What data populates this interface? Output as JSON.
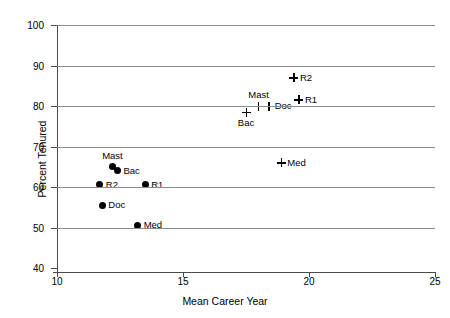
{
  "chart_data": {
    "type": "scatter",
    "title": "",
    "xlabel": "Mean Career Year",
    "ylabel": "Percent Tenured",
    "xlim": [
      10,
      25
    ],
    "ylim": [
      40,
      100
    ],
    "xticks": [
      10,
      15,
      20,
      25
    ],
    "yticks": [
      40,
      50,
      60,
      70,
      80,
      90,
      100
    ],
    "grid": "horizontal",
    "legend": "none",
    "series": [
      {
        "name": "filled-circle-group",
        "marker": "filled-circle",
        "points": [
          {
            "label": "Mast",
            "x": 12.2,
            "y": 65.0,
            "label_pos": "above"
          },
          {
            "label": "Bac",
            "x": 12.4,
            "y": 64.0,
            "label_pos": "right"
          },
          {
            "label": "R2",
            "x": 11.7,
            "y": 60.5,
            "label_pos": "right"
          },
          {
            "label": "R1",
            "x": 13.5,
            "y": 60.5,
            "label_pos": "right"
          },
          {
            "label": "Doc",
            "x": 11.8,
            "y": 55.5,
            "label_pos": "right"
          },
          {
            "label": "Med",
            "x": 13.2,
            "y": 50.5,
            "label_pos": "right"
          }
        ]
      },
      {
        "name": "plus-marker-group",
        "marker": "plus",
        "points": [
          {
            "label": "R2",
            "x": 19.4,
            "y": 87.0,
            "label_pos": "right"
          },
          {
            "label": "R1",
            "x": 19.6,
            "y": 81.5,
            "label_pos": "right"
          },
          {
            "label": "Mast",
            "x": 18.0,
            "y": 80.0,
            "label_pos": "above"
          },
          {
            "label": "Doc",
            "x": 18.4,
            "y": 80.0,
            "label_pos": "right"
          },
          {
            "label": "Bac",
            "x": 17.5,
            "y": 78.5,
            "label_pos": "below"
          },
          {
            "label": "Med",
            "x": 18.9,
            "y": 66.0,
            "label_pos": "right"
          }
        ]
      }
    ],
    "colors": {
      "marker": "#000000",
      "gridline": "#8c8c8c",
      "axis": "#4a4a4a",
      "background": "#ffffff"
    }
  }
}
